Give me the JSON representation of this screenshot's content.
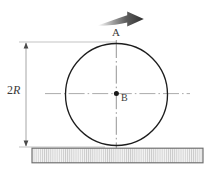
{
  "figure": {
    "labels": {
      "top_point": "A",
      "center_point": "B",
      "dimension": "2R",
      "dimension_number": "2",
      "dimension_symbol": "R"
    },
    "colors": {
      "outline": "#1a1a1a",
      "centerline": "#9a9a9a",
      "dimension_line": "#8a8a8a",
      "arrow_dark": "#3b3b3b",
      "arrow_light": "#e9e9e9",
      "ground_fill": "#f2f2f2",
      "ground_border": "#6a6a6a",
      "hatch": "#c2c2c2",
      "text": "#3a3a3a",
      "background": "#ffffff"
    },
    "geometry": {
      "circle_center_x": 116.5,
      "circle_center_y": 94.5,
      "circle_radius": 51,
      "ground_left": 32,
      "ground_right": 203,
      "ground_top": 148,
      "ground_bottom": 163,
      "dimension_x": 26,
      "dimension_top_y": 42,
      "dimension_bottom_y": 147,
      "arrow_start_x": 98,
      "arrow_tip_x": 144,
      "arrow_y": 19
    },
    "elements": {
      "circle": "wheel-circle",
      "vertical_axis": "vertical-centerline",
      "horizontal_axis": "horizontal-centerline",
      "arrow": "rotation-direction-arrow",
      "ground": "hatched-ground-block",
      "dimension": "diameter-dimension-line"
    }
  }
}
